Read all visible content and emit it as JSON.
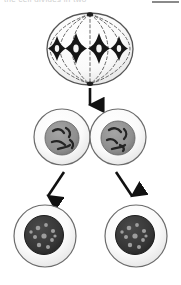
{
  "figure": {
    "clipped_header_text": "the cell divides in two",
    "stages": [
      {
        "id": "stage-metaphase",
        "label": "metaphase-cell",
        "chromosome_count": 4,
        "spindle_fiber_count": 7,
        "pole_count": 2
      },
      {
        "id": "stage-telophase",
        "label": "two-joined-daughter-cells",
        "cell_count": 2,
        "nucleus_fill": "#8c8c8c"
      },
      {
        "id": "stage-separated",
        "label": "two-separated-daughter-cells",
        "cell_count": 2,
        "nucleus_fill": "#3a3a3a"
      }
    ],
    "arrows": [
      {
        "id": "arrow-down",
        "direction": "down"
      },
      {
        "id": "arrow-down-left",
        "direction": "down-left"
      },
      {
        "id": "arrow-down-right",
        "direction": "down-right"
      }
    ],
    "colors": {
      "outline": "#6b6b6b",
      "cell_fill": "#fbfbfb",
      "cytoplasm_shade": "#e8e8e8",
      "nucleus_gray": "#8c8c8c",
      "nucleus_dark": "#3a3a3a",
      "chromosome": "#1a1a1a",
      "arrow": "#111111",
      "spindle": "#555555",
      "background": "#ffffff"
    }
  }
}
